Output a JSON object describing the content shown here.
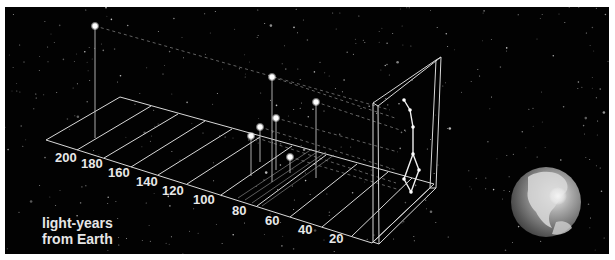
{
  "figure": {
    "caption_line1": "light-years",
    "caption_line2": "from Earth",
    "background_color": "#020202",
    "line_color": "#d8d8d8"
  },
  "axis": {
    "unit": "light-years from Earth",
    "ticks": [
      {
        "label": "200",
        "x": 55,
        "y": 162
      },
      {
        "label": "180",
        "x": 81,
        "y": 168
      },
      {
        "label": "160",
        "x": 108,
        "y": 177
      },
      {
        "label": "140",
        "x": 136,
        "y": 186
      },
      {
        "label": "120",
        "x": 162,
        "y": 195
      },
      {
        "label": "100",
        "x": 193,
        "y": 204
      },
      {
        "label": "80",
        "x": 232,
        "y": 215
      },
      {
        "label": "60",
        "x": 265,
        "y": 225
      },
      {
        "label": "40",
        "x": 298,
        "y": 234
      },
      {
        "label": "20",
        "x": 329,
        "y": 243
      }
    ]
  },
  "stars": [
    {
      "name": "far-star",
      "x": 95,
      "y": 26,
      "base_y": 138
    },
    {
      "name": "star-2",
      "x": 272,
      "y": 77,
      "base_y": 182
    },
    {
      "name": "star-3",
      "x": 316,
      "y": 102,
      "base_y": 178
    },
    {
      "name": "star-4",
      "x": 276,
      "y": 118,
      "base_y": 170
    },
    {
      "name": "star-5",
      "x": 260,
      "y": 127,
      "base_y": 162
    },
    {
      "name": "star-6",
      "x": 251,
      "y": 136,
      "base_y": 176
    },
    {
      "name": "star-7",
      "x": 290,
      "y": 157,
      "base_y": 173
    }
  ],
  "constellation": {
    "name": "Big Dipper",
    "points": [
      [
        404,
        100
      ],
      [
        410,
        110
      ],
      [
        413,
        127
      ],
      [
        413,
        154
      ],
      [
        404,
        179
      ],
      [
        419,
        170
      ],
      [
        411,
        192
      ]
    ]
  },
  "earth": {
    "cx": 546,
    "cy": 202,
    "r": 35
  }
}
